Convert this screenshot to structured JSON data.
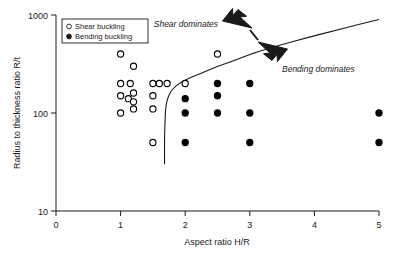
{
  "chart_data": {
    "type": "scatter",
    "title": "",
    "xlabel": "Aspect ratio H/R",
    "ylabel": "Radius to thickness ratio R/t",
    "xlim": [
      0,
      5
    ],
    "ylim": [
      10,
      1000
    ],
    "yscale": "log",
    "xscale": "linear",
    "grid": false,
    "xticks": [
      0,
      1,
      2,
      3,
      4,
      5
    ],
    "xticklabels": [
      "0",
      "1",
      "2",
      "3",
      "4",
      "5"
    ],
    "yticks": [
      10,
      100,
      1000
    ],
    "yticklabels": [
      "10",
      "100",
      "1000"
    ],
    "legend_position": "upper-left",
    "series": [
      {
        "name": "Shear buckling",
        "marker": "open-circle",
        "color": "#000000",
        "fill": "#ffffff",
        "points": [
          [
            1.0,
            400
          ],
          [
            1.2,
            300
          ],
          [
            1.0,
            200
          ],
          [
            1.15,
            200
          ],
          [
            1.0,
            150
          ],
          [
            1.2,
            160
          ],
          [
            1.12,
            140
          ],
          [
            1.2,
            130
          ],
          [
            1.0,
            100
          ],
          [
            1.2,
            110
          ],
          [
            1.5,
            200
          ],
          [
            1.6,
            200
          ],
          [
            1.72,
            200
          ],
          [
            1.5,
            150
          ],
          [
            1.5,
            110
          ],
          [
            1.5,
            50
          ],
          [
            2.0,
            200
          ],
          [
            2.5,
            400
          ]
        ]
      },
      {
        "name": "Bending buckling",
        "marker": "filled-circle",
        "color": "#000000",
        "fill": "#000000",
        "points": [
          [
            2.0,
            140
          ],
          [
            2.0,
            100
          ],
          [
            2.0,
            50
          ],
          [
            2.5,
            200
          ],
          [
            2.5,
            150
          ],
          [
            2.5,
            100
          ],
          [
            3.0,
            200
          ],
          [
            3.0,
            100
          ],
          [
            3.0,
            50
          ],
          [
            5.0,
            100
          ],
          [
            5.0,
            50
          ]
        ]
      }
    ],
    "boundary_curve": {
      "name": "shear-bending transition",
      "description": "Transition boundary separating shear dominated region (above-left) from bending dominated region (below-right)",
      "points": [
        [
          1.68,
          30
        ],
        [
          1.68,
          60
        ],
        [
          1.69,
          90
        ],
        [
          1.7,
          120
        ],
        [
          1.74,
          150
        ],
        [
          1.8,
          175
        ],
        [
          1.9,
          200
        ],
        [
          2.05,
          225
        ],
        [
          2.25,
          255
        ],
        [
          2.5,
          300
        ],
        [
          2.8,
          350
        ],
        [
          3.1,
          420
        ],
        [
          3.5,
          500
        ],
        [
          3.9,
          590
        ],
        [
          4.3,
          690
        ],
        [
          4.65,
          790
        ],
        [
          5.0,
          900
        ]
      ]
    },
    "annotations": [
      {
        "text": "Shear dominates",
        "x": 2.55,
        "y": 620,
        "arrow": "up-left"
      },
      {
        "text": "Bending dominates",
        "x": 3.55,
        "y": 215,
        "arrow": "down-right"
      }
    ]
  },
  "legend": {
    "items": [
      {
        "label": "Shear buckling",
        "marker": "open-circle"
      },
      {
        "label": "Bending buckling",
        "marker": "filled-circle"
      }
    ]
  }
}
